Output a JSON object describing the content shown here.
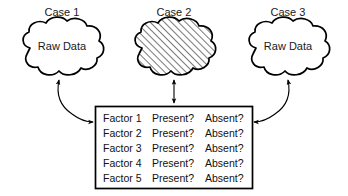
{
  "diagram": {
    "title_labels": {
      "case1": "Case 1",
      "case2": "Case 2",
      "case3": "Case 3"
    },
    "clouds": [
      {
        "name": "case1-cloud",
        "label": "Raw Data",
        "fill": "white",
        "hatched": false
      },
      {
        "name": "case2-cloud",
        "label": "",
        "fill": "hatched",
        "hatched": true
      },
      {
        "name": "case3-cloud",
        "label": "Raw Data",
        "fill": "white",
        "hatched": false
      }
    ],
    "table": {
      "rows": [
        {
          "factor": "Factor 1",
          "present": "Present?",
          "absent": "Absent?"
        },
        {
          "factor": "Factor 2",
          "present": "Present?",
          "absent": "Absent?"
        },
        {
          "factor": "Factor 3",
          "present": "Present?",
          "absent": "Absent?"
        },
        {
          "factor": "Factor 4",
          "present": "Present?",
          "absent": "Absent?"
        },
        {
          "factor": "Factor 5",
          "present": "Present?",
          "absent": "Absent?"
        }
      ]
    },
    "connectors": [
      {
        "name": "case1-connector",
        "style": "curved-double-arrow"
      },
      {
        "name": "case2-connector",
        "style": "straight-double-arrow"
      },
      {
        "name": "case3-connector",
        "style": "curved-double-arrow"
      }
    ],
    "colors": {
      "stroke": "#000000",
      "background": "#ffffff",
      "text": "#111111"
    }
  }
}
